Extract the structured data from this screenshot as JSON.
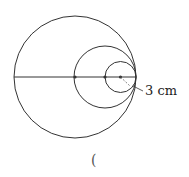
{
  "diagram": {
    "label": "3 cm",
    "answer_paren": "(",
    "colors": {
      "stroke": "#333333",
      "dot": "#333333"
    },
    "circles": [
      {
        "name": "large",
        "cx": 75,
        "cy": 77,
        "r": 61
      },
      {
        "name": "medium",
        "cx": 105,
        "cy": 77,
        "r": 31
      },
      {
        "name": "small",
        "cx": 120.5,
        "cy": 77,
        "r": 15.5
      }
    ]
  }
}
